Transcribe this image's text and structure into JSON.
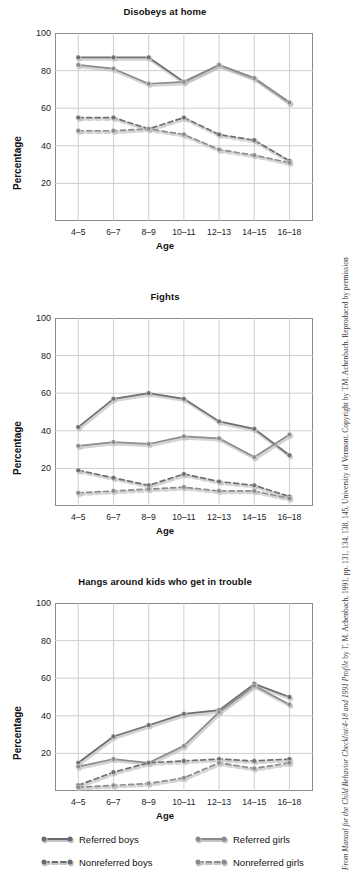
{
  "figure": {
    "credit": "From Manual for the Child Behavior Checklist/4-18 and 1991 Profile by T. M. Achenbach, 1991, pp. 131, 134, 138, 145, University of Vermont. Copyright by T.M. Achenbach. Reproduced by permission",
    "credit_italic_part": "From Manual for the Child Behavior Checklist/4-18 and 1991 Profile",
    "credit_plain_part": " by T. M. Achenbach, 1991, pp. 131, 134, 138, 145, University of Vermont. Copyright by T.M. Achenbach. Reproduced by permission"
  },
  "axis": {
    "ylabel": "Percentage",
    "xlabel": "Age",
    "yticks": [
      "100",
      "80",
      "60",
      "40",
      "20"
    ],
    "ytick_values": [
      100,
      80,
      60,
      40,
      20
    ],
    "xticks": [
      "4–5",
      "6–7",
      "8–9",
      "10–11",
      "12–13",
      "14–15",
      "16–18"
    ]
  },
  "legend": {
    "items": [
      {
        "label": "Referred boys",
        "style": "solid",
        "color": "#6b6b6b"
      },
      {
        "label": "Referred girls",
        "style": "solid",
        "color": "#8a8a8a"
      },
      {
        "label": "Nonreferred boys",
        "style": "dashed",
        "color": "#6b6b6b"
      },
      {
        "label": "Nonreferred girls",
        "style": "dashed",
        "color": "#8a8a8a"
      }
    ]
  },
  "chart_data": [
    {
      "type": "line",
      "title": "Disobeys at home",
      "xlabel": "Age",
      "ylabel": "Percentage",
      "categories": [
        "4–5",
        "6–7",
        "8–9",
        "10–11",
        "12–13",
        "14–15",
        "16–18"
      ],
      "ylim": [
        0,
        100
      ],
      "grid": true,
      "legend_position": "below-figure",
      "series": [
        {
          "name": "Referred boys",
          "style": "solid",
          "values": [
            87,
            87,
            87,
            74,
            83,
            76,
            63
          ]
        },
        {
          "name": "Referred girls",
          "style": "solid",
          "values": [
            83,
            81,
            73,
            74,
            83,
            76,
            63
          ]
        },
        {
          "name": "Nonreferred boys",
          "style": "dashed",
          "values": [
            55,
            55,
            49,
            55,
            46,
            43,
            32
          ]
        },
        {
          "name": "Nonreferred girls",
          "style": "dashed",
          "values": [
            48,
            48,
            49,
            46,
            38,
            35,
            31
          ]
        }
      ]
    },
    {
      "type": "line",
      "title": "Fights",
      "xlabel": "Age",
      "ylabel": "Percentage",
      "categories": [
        "4–5",
        "6–7",
        "8–9",
        "10–11",
        "12–13",
        "14–15",
        "16–18"
      ],
      "ylim": [
        0,
        100
      ],
      "grid": true,
      "legend_position": "below-figure",
      "series": [
        {
          "name": "Referred boys",
          "style": "solid",
          "values": [
            42,
            57,
            60,
            57,
            45,
            41,
            27
          ]
        },
        {
          "name": "Referred girls",
          "style": "solid",
          "values": [
            32,
            34,
            33,
            37,
            36,
            26,
            38
          ]
        },
        {
          "name": "Nonreferred boys",
          "style": "dashed",
          "values": [
            19,
            15,
            11,
            17,
            13,
            11,
            5
          ]
        },
        {
          "name": "Nonreferred girls",
          "style": "dashed",
          "values": [
            7,
            8,
            9,
            10,
            8,
            8,
            4
          ]
        }
      ]
    },
    {
      "type": "line",
      "title": "Hangs around kids who get in trouble",
      "xlabel": "Age",
      "ylabel": "Percentage",
      "categories": [
        "4–5",
        "6–7",
        "8–9",
        "10–11",
        "12–13",
        "14–15",
        "16–18"
      ],
      "ylim": [
        0,
        100
      ],
      "grid": true,
      "legend_position": "below-figure",
      "series": [
        {
          "name": "Referred boys",
          "style": "solid",
          "values": [
            15,
            29,
            35,
            41,
            43,
            57,
            50
          ]
        },
        {
          "name": "Referred girls",
          "style": "solid",
          "values": [
            13,
            17,
            15,
            24,
            42,
            56,
            46
          ]
        },
        {
          "name": "Nonreferred boys",
          "style": "dashed",
          "values": [
            3,
            10,
            15,
            16,
            17,
            16,
            17
          ]
        },
        {
          "name": "Nonreferred girls",
          "style": "dashed",
          "values": [
            2,
            3,
            4,
            7,
            15,
            12,
            15
          ]
        }
      ]
    }
  ]
}
